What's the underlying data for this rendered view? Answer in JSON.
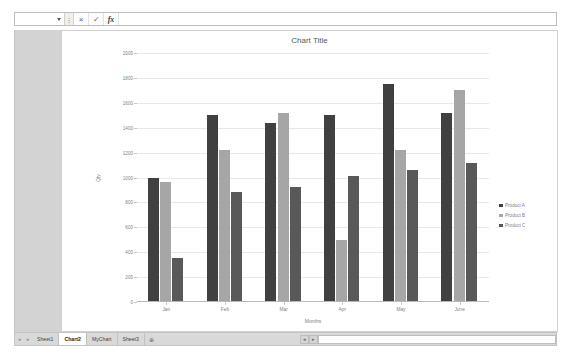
{
  "formula_bar": {
    "name_box_value": "",
    "name_box_icon": "chevron-down-icon",
    "cancel_icon": "×",
    "confirm_icon": "✓",
    "function_icon": "fx",
    "input_value": "",
    "input_placeholder": ""
  },
  "chart": {
    "title": "Chart Title",
    "legend_position": "right"
  },
  "chart_data": {
    "type": "bar",
    "title": "Chart Title",
    "xlabel": "Months",
    "ylabel": "Qty",
    "categories": [
      "Jan",
      "Feb",
      "Mar",
      "Apr",
      "May",
      "June"
    ],
    "series": [
      {
        "name": "Product A",
        "color": "#404040",
        "values": [
          1000,
          1500,
          1440,
          1500,
          1750,
          1520
        ]
      },
      {
        "name": "Product B",
        "color": "#a6a6a6",
        "values": [
          960,
          1220,
          1520,
          500,
          1220,
          1700
        ]
      },
      {
        "name": "Product C",
        "color": "#595959",
        "values": [
          350,
          880,
          920,
          1010,
          1060,
          1120
        ]
      }
    ],
    "ylim": [
      0,
      2000
    ],
    "ytick_step": 200,
    "yticks": [
      0,
      200,
      400,
      600,
      800,
      1000,
      1200,
      1400,
      1600,
      1800,
      2000
    ],
    "grid": true
  },
  "sheet_bar": {
    "nav_first": "◂",
    "nav_prev": "◂",
    "tabs": [
      {
        "label": "Sheet1",
        "active": false
      },
      {
        "label": "Chart2",
        "active": true
      },
      {
        "label": "MyChart",
        "active": false
      },
      {
        "label": "Sheet3",
        "active": false
      }
    ],
    "add_sheet_label": "⊕",
    "scroll_left_icon": "◂",
    "scroll_right_icon": "▸"
  }
}
